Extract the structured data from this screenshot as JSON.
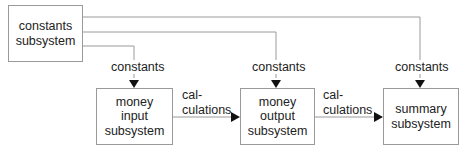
{
  "diagram": {
    "type": "data-flow block diagram",
    "nodes": [
      {
        "id": "constants",
        "lines": [
          "constants",
          "subsystem"
        ]
      },
      {
        "id": "money_input",
        "lines": [
          "money",
          "input",
          "subsystem"
        ]
      },
      {
        "id": "money_output",
        "lines": [
          "money",
          "output",
          "subsystem"
        ]
      },
      {
        "id": "summary",
        "lines": [
          "summary",
          "subsystem"
        ]
      }
    ],
    "edges": [
      {
        "from": "constants",
        "to": "money_input",
        "label": "constants"
      },
      {
        "from": "constants",
        "to": "money_output",
        "label": "constants"
      },
      {
        "from": "constants",
        "to": "summary",
        "label": "constants"
      },
      {
        "from": "money_input",
        "to": "money_output",
        "label_lines": [
          "cal-",
          "culations"
        ]
      },
      {
        "from": "money_output",
        "to": "summary",
        "label_lines": [
          "cal-",
          "culations"
        ]
      }
    ],
    "colors": {
      "line": "#9a9a9a",
      "arrowhead": "#111111",
      "text": "#222222"
    }
  }
}
